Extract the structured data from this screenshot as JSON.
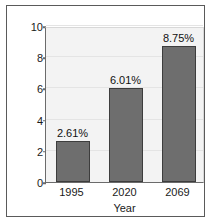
{
  "chart_data": {
    "type": "bar",
    "title": "",
    "xlabel": "Year",
    "ylabel": "",
    "categories": [
      "1995",
      "2020",
      "2069"
    ],
    "values": [
      2.61,
      6.01,
      8.75
    ],
    "data_labels": [
      "2.61%",
      "6.01%",
      "8.75%"
    ],
    "ylim": [
      0,
      10
    ],
    "yticks": [
      0,
      2,
      4,
      6,
      8,
      10
    ],
    "ytick_labels": [
      "0",
      "2",
      "4",
      "6",
      "8",
      "10"
    ],
    "grid": true,
    "legend": false,
    "colors": {
      "bar_fill": "#6e6e6e",
      "bar_edge": "#3d3d3d",
      "plot_background": "#f3f3f3",
      "gridline": "#e4e4e4",
      "axis_line": "#6b6b6b",
      "frame_border": "#5a5a5a",
      "text": "#1a1a1a",
      "figure_background": "#ffffff"
    }
  }
}
